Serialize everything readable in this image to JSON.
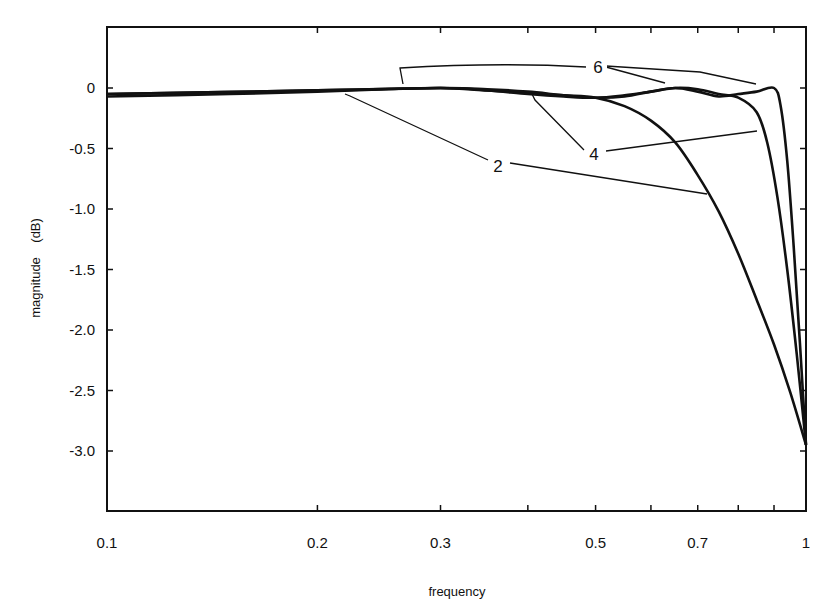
{
  "chart_data": {
    "type": "line",
    "title": "",
    "xlabel": "frequency",
    "ylabel": "magnitude    (dB)",
    "xscale": "log",
    "xlim": [
      0.1,
      1.0
    ],
    "ylim": [
      -3.5,
      0.5
    ],
    "grid": false,
    "legend": "inline labels with leader lines",
    "x_ticks": [
      {
        "value": 0.1,
        "label": "0.1"
      },
      {
        "value": 0.2,
        "label": "0.2"
      },
      {
        "value": 0.3,
        "label": "0.3"
      },
      {
        "value": 0.4,
        "label": ""
      },
      {
        "value": 0.5,
        "label": "0.5"
      },
      {
        "value": 0.6,
        "label": ""
      },
      {
        "value": 0.7,
        "label": "0.7"
      },
      {
        "value": 0.8,
        "label": ""
      },
      {
        "value": 0.9,
        "label": ""
      },
      {
        "value": 1.0,
        "label": "1"
      }
    ],
    "y_ticks": [
      {
        "value": 0,
        "label": "0"
      },
      {
        "value": -0.5,
        "label": "-0.5"
      },
      {
        "value": -1.0,
        "label": "-1.0"
      },
      {
        "value": -1.5,
        "label": "-1.5"
      },
      {
        "value": -2.0,
        "label": "-2.0"
      },
      {
        "value": -2.5,
        "label": "-2.5"
      },
      {
        "value": -3.0,
        "label": "-3.0"
      }
    ],
    "series": [
      {
        "name": "2",
        "x": [
          0.1,
          0.15,
          0.2,
          0.25,
          0.3,
          0.35,
          0.4,
          0.45,
          0.5,
          0.55,
          0.6,
          0.65,
          0.7,
          0.75,
          0.8,
          0.85,
          0.9,
          0.95,
          1.0
        ],
        "y": [
          -0.07,
          -0.05,
          -0.03,
          -0.01,
          0.0,
          -0.02,
          -0.04,
          -0.06,
          -0.08,
          -0.15,
          -0.27,
          -0.45,
          -0.72,
          -1.02,
          -1.37,
          -1.75,
          -2.12,
          -2.52,
          -2.95
        ]
      },
      {
        "name": "4",
        "x": [
          0.1,
          0.2,
          0.3,
          0.35,
          0.4,
          0.45,
          0.5,
          0.55,
          0.6,
          0.65,
          0.7,
          0.75,
          0.8,
          0.85,
          0.88,
          0.91,
          0.94,
          0.97,
          1.0
        ],
        "y": [
          -0.05,
          -0.02,
          0.0,
          -0.02,
          -0.05,
          -0.07,
          -0.08,
          -0.06,
          -0.03,
          0.0,
          -0.01,
          -0.05,
          -0.08,
          -0.2,
          -0.45,
          -0.9,
          -1.5,
          -2.2,
          -2.95
        ]
      },
      {
        "name": "6",
        "x": [
          0.1,
          0.2,
          0.3,
          0.35,
          0.4,
          0.45,
          0.5,
          0.55,
          0.6,
          0.65,
          0.7,
          0.75,
          0.8,
          0.85,
          0.9,
          0.92,
          0.94,
          0.96,
          0.98,
          1.0
        ],
        "y": [
          -0.05,
          -0.02,
          0.0,
          -0.01,
          -0.03,
          -0.06,
          -0.08,
          -0.07,
          -0.03,
          0.0,
          -0.03,
          -0.07,
          -0.05,
          -0.03,
          0.0,
          -0.15,
          -0.6,
          -1.3,
          -2.1,
          -2.95
        ]
      }
    ],
    "annotations": [
      {
        "text": "6",
        "x_px": 598,
        "y_px": 68
      },
      {
        "text": "4",
        "x_px": 594,
        "y_px": 155
      },
      {
        "text": "2",
        "x_px": 498,
        "y_px": 167
      }
    ]
  }
}
